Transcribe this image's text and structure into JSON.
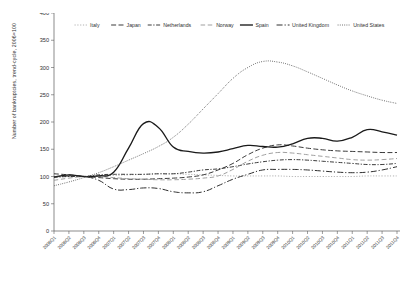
{
  "chart_data": {
    "type": "line",
    "title": "",
    "xlabel": "",
    "ylabel": "Number of bankruptcies, trend-cycle, 2006=100",
    "ylim": [
      0,
      400
    ],
    "ytick_labels": [
      "0",
      "50",
      "100",
      "150",
      "200",
      "250",
      "300",
      "350",
      "400"
    ],
    "ytick_values": [
      0,
      50,
      100,
      150,
      200,
      250,
      300,
      350,
      400
    ],
    "grid": false,
    "legend_position": "top-inside-horizontal",
    "categories": [
      "2006Q1",
      "2006Q2",
      "2006Q3",
      "2006Q4",
      "2007Q1",
      "2007Q2",
      "2007Q3",
      "2007Q4",
      "2008Q1",
      "2008Q2",
      "2008Q3",
      "2008Q4",
      "2009Q1",
      "2009Q2",
      "2009Q3",
      "2009Q4",
      "2010Q1",
      "2010Q2",
      "2010Q3",
      "2010Q4",
      "2011Q1",
      "2011Q2",
      "2011Q3",
      "2011Q4"
    ],
    "series": [
      {
        "name": "Italy",
        "style": "dotted-light",
        "color": "#9a9a9a",
        "values": [
          98,
          100,
          100,
          101,
          102,
          103,
          104,
          105,
          105,
          104,
          103,
          102,
          101,
          101,
          101,
          101,
          100,
          100,
          100,
          100,
          100,
          101,
          101,
          101
        ]
      },
      {
        "name": "Japan",
        "style": "long-dash",
        "color": "#2f2f2f",
        "values": [
          105,
          103,
          100,
          98,
          96,
          95,
          95,
          96,
          97,
          99,
          103,
          112,
          124,
          140,
          152,
          158,
          156,
          152,
          149,
          147,
          146,
          145,
          144,
          144
        ]
      },
      {
        "name": "Netherlands",
        "style": "dash-dot",
        "color": "#2f2f2f",
        "values": [
          99,
          100,
          100,
          103,
          104,
          104,
          104,
          105,
          105,
          108,
          112,
          114,
          118,
          123,
          127,
          130,
          131,
          130,
          128,
          126,
          124,
          122,
          122,
          124
        ]
      },
      {
        "name": "Norway",
        "style": "gray-dash",
        "color": "#9a9a9a",
        "values": [
          93,
          97,
          100,
          100,
          98,
          96,
          95,
          94,
          94,
          95,
          97,
          101,
          113,
          128,
          139,
          144,
          143,
          140,
          137,
          134,
          131,
          130,
          131,
          133
        ]
      },
      {
        "name": "Spain",
        "style": "solid",
        "color": "#1a1a1a",
        "values": [
          99,
          103,
          100,
          101,
          108,
          152,
          197,
          190,
          154,
          146,
          143,
          145,
          151,
          157,
          155,
          154,
          160,
          170,
          170,
          165,
          172,
          186,
          182,
          176
        ]
      },
      {
        "name": "United Kingdom",
        "style": "dash-dot-long",
        "color": "#2f2f2f",
        "values": [
          99,
          101,
          100,
          93,
          77,
          76,
          79,
          78,
          72,
          70,
          72,
          83,
          95,
          104,
          112,
          113,
          113,
          112,
          110,
          108,
          107,
          108,
          112,
          118
        ]
      },
      {
        "name": "United States",
        "style": "fine-dotted",
        "color": "#4a4a4a",
        "values": [
          83,
          90,
          98,
          107,
          118,
          130,
          142,
          155,
          172,
          196,
          224,
          252,
          280,
          300,
          311,
          310,
          303,
          292,
          280,
          268,
          257,
          248,
          240,
          234
        ]
      }
    ]
  },
  "legend": {
    "items": [
      {
        "label": "Italy"
      },
      {
        "label": "Japan"
      },
      {
        "label": "Netherlands"
      },
      {
        "label": "Norway"
      },
      {
        "label": "Spain"
      },
      {
        "label": "United Kingdom"
      },
      {
        "label": "United States"
      }
    ]
  },
  "axes": {
    "y_title": "Number of bankruptcies, trend-cycle, 2006=100"
  }
}
